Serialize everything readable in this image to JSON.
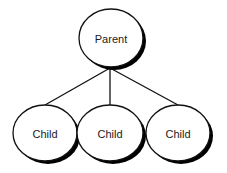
{
  "diagram": {
    "type": "tree-hierarchy",
    "colors": {
      "background": "#ffffff",
      "stroke": "#111111",
      "shadow": "#000000",
      "node_fill": "#ffffff",
      "text": "#1a1a1a"
    },
    "root": {
      "label": "Parent",
      "cx": 111,
      "cy": 38,
      "rx": 32,
      "ry": 29
    },
    "children": [
      {
        "label": "Child",
        "cx": 45,
        "cy": 133,
        "rx": 32,
        "ry": 28
      },
      {
        "label": "Child",
        "cx": 110,
        "cy": 133,
        "rx": 33,
        "ry": 28
      },
      {
        "label": "Child",
        "cx": 178,
        "cy": 133,
        "rx": 32,
        "ry": 28
      }
    ],
    "junction": {
      "x": 110,
      "y": 68
    }
  }
}
